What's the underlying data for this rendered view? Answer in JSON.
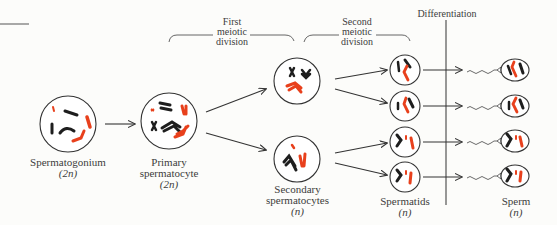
{
  "diagram": {
    "colors": {
      "maternal_chromosome": "#e8401c",
      "paternal_chromosome": "#1e1e1e",
      "line": "#333333",
      "background": "#fcfcfa"
    },
    "phases": [
      {
        "id": "first-meiotic",
        "lines": [
          "First",
          "meiotic",
          "division"
        ]
      },
      {
        "id": "second-meiotic",
        "lines": [
          "Second",
          "meiotic",
          "division"
        ]
      },
      {
        "id": "differentiation",
        "lines": [
          "Differentiation"
        ]
      }
    ],
    "cells": [
      {
        "id": "spermatogonium",
        "name": "Spermatogonium",
        "ploidy": "(2n)",
        "count": 1
      },
      {
        "id": "primary-spermatocyte",
        "name_lines": [
          "Primary",
          "spermatocyte"
        ],
        "ploidy": "(2n)",
        "count": 1
      },
      {
        "id": "secondary-spermatocytes",
        "name_lines": [
          "Secondary",
          "spermatocytes"
        ],
        "ploidy": "(n)",
        "count": 2
      },
      {
        "id": "spermatids",
        "name": "Spermatids",
        "ploidy": "(n)",
        "count": 4
      },
      {
        "id": "sperm",
        "name": "Sperm",
        "ploidy": "(n)",
        "count": 4
      }
    ]
  }
}
